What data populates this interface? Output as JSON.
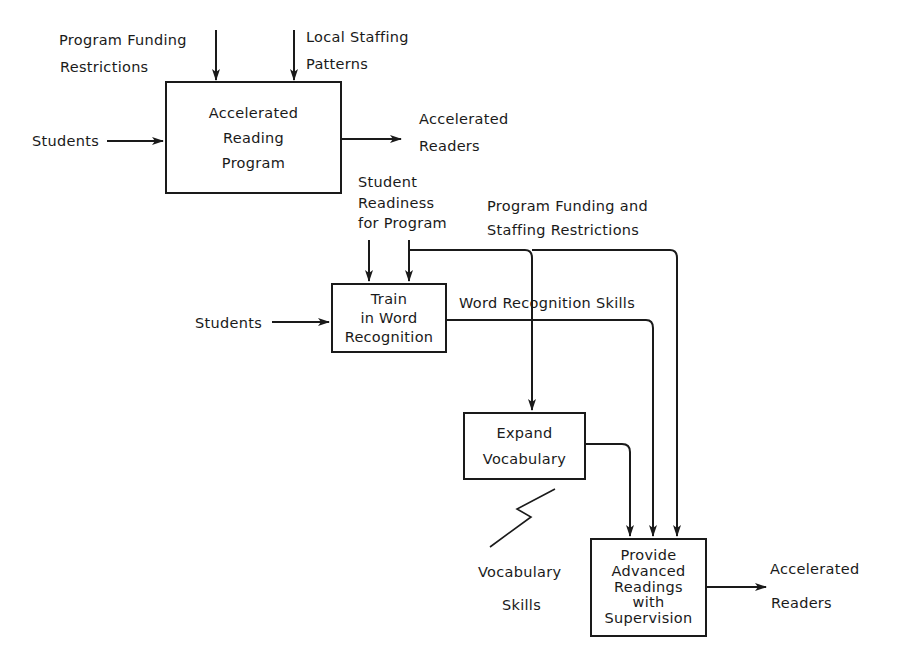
{
  "top_diagram": {
    "controls": {
      "program_funding": [
        "Program Funding",
        "Restrictions"
      ],
      "local_staffing": [
        "Local Staffing",
        "Patterns"
      ]
    },
    "input": "Students",
    "process": [
      "Accelerated",
      "Reading",
      "Program"
    ],
    "output": [
      "Accelerated",
      "Readers"
    ]
  },
  "detail_diagram": {
    "controls": {
      "student_readiness": [
        "Student",
        "Readiness",
        "for Program"
      ],
      "funding_staffing": [
        "Program Funding and",
        "Staffing Restrictions"
      ]
    },
    "input": "Students",
    "boxes": {
      "train": [
        "Train",
        "in Word",
        "Recognition"
      ],
      "expand": [
        "Expand",
        "Vocabulary"
      ],
      "provide": [
        "Provide",
        "Advanced",
        "Readings",
        "with",
        "Supervision"
      ]
    },
    "flows": {
      "word_recognition": "Word Recognition Skills",
      "vocabulary_skills": [
        "Vocabulary",
        "Skills"
      ]
    },
    "output": [
      "Accelerated",
      "Readers"
    ]
  }
}
